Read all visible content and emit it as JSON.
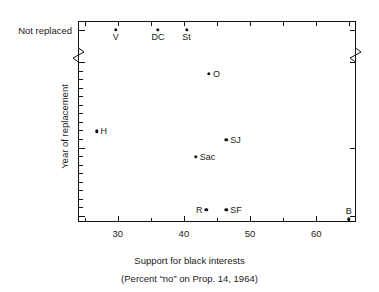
{
  "chart_data": {
    "type": "scatter",
    "title": "REPLACEMENT AND REPLACEMENT",
    "xlabel": "Support for black interests",
    "xlabel_sub": "(Percent “no” on Prop. 14, 1964)",
    "ylabel": "Year of replacement",
    "xlim": [
      24,
      66
    ],
    "ylim": [
      1961,
      1981
    ],
    "grid": false,
    "legend": "none",
    "xticks": [
      30,
      40,
      50,
      60
    ],
    "xtick_labels": [
      "30",
      "40",
      "50",
      "60"
    ],
    "xminor_ticks": [
      25,
      35,
      45,
      55,
      65
    ],
    "yticks": [
      1962,
      1970,
      1980
    ],
    "ytick_labels": [
      "1962",
      "1970",
      "1980"
    ],
    "y_special_label": "Not replaced",
    "y_axis_break": true,
    "points": [
      {
        "label": "V",
        "x": 29.7,
        "y_category": "Not replaced",
        "label_pos": "below"
      },
      {
        "label": "DC",
        "x": 36.1,
        "y_category": "Not replaced",
        "label_pos": "below"
      },
      {
        "label": "St",
        "x": 40.4,
        "y_category": "Not replaced",
        "label_pos": "below"
      },
      {
        "label": "O",
        "x": 43.8,
        "y": 1978.6,
        "label_pos": "right"
      },
      {
        "label": "H",
        "x": 26.8,
        "y": 1971.9,
        "label_pos": "right"
      },
      {
        "label": "SJ",
        "x": 46.4,
        "y": 1970.9,
        "label_pos": "right"
      },
      {
        "label": "Sac",
        "x": 41.8,
        "y": 1968.9,
        "label_pos": "right"
      },
      {
        "label": "R",
        "x": 43.4,
        "y": 1962.7,
        "label_pos": "left"
      },
      {
        "label": "SF",
        "x": 46.4,
        "y": 1962.7,
        "label_pos": "right"
      },
      {
        "label": "B",
        "x": 64.9,
        "y": 1961.6,
        "label_pos": "above"
      }
    ]
  },
  "colors": {
    "axis": "#111111",
    "point": "#111111",
    "text": "#1a1a1a",
    "background": "#ffffff"
  }
}
